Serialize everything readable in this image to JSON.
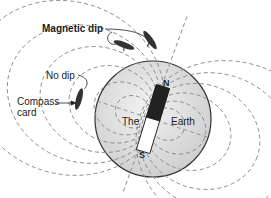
{
  "diagram": {
    "labels": {
      "magnetic_dip": "Magnetic dip",
      "no_dip": "No dip",
      "compass_card_line1": "Compass",
      "compass_card_line2": "card",
      "the": "The",
      "earth": "Earth",
      "north": "N",
      "south": "S"
    },
    "colors": {
      "earth_fill": "#e2e2e2",
      "earth_stroke": "#333333",
      "field_lines": "#8a8a8a",
      "magnet_north": "#222222",
      "magnet_south": "#ffffff",
      "text": "#222222"
    }
  }
}
